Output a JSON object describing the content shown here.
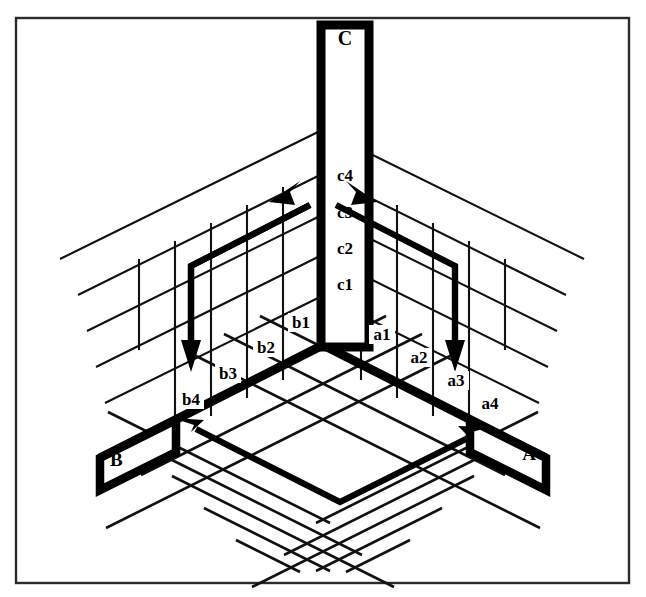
{
  "figure": {
    "background_color": "#ffffff",
    "line_color": "#000000",
    "frame_color": "#2b2b2b"
  },
  "axes": {
    "vertical": {
      "name": "C",
      "apex_label": "C",
      "ticks": [
        "c1",
        "c2",
        "c3",
        "c4"
      ]
    },
    "right": {
      "name": "A",
      "corner_label": "A",
      "ticks": [
        "a1",
        "a2",
        "a3",
        "a4"
      ]
    },
    "left": {
      "name": "B",
      "corner_label": "B",
      "ticks": [
        "b1",
        "b2",
        "b3",
        "b4"
      ]
    }
  },
  "arrows": [
    {
      "id": "left-wall-up",
      "direction": "up-right",
      "face": "left-wall"
    },
    {
      "id": "left-wall-down",
      "direction": "down",
      "face": "left-wall"
    },
    {
      "id": "right-wall-up",
      "direction": "up-left",
      "face": "right-wall"
    },
    {
      "id": "right-wall-down",
      "direction": "down",
      "face": "right-wall"
    },
    {
      "id": "floor-left",
      "direction": "up-left",
      "face": "floor"
    },
    {
      "id": "floor-right",
      "direction": "up-right",
      "face": "floor"
    }
  ]
}
